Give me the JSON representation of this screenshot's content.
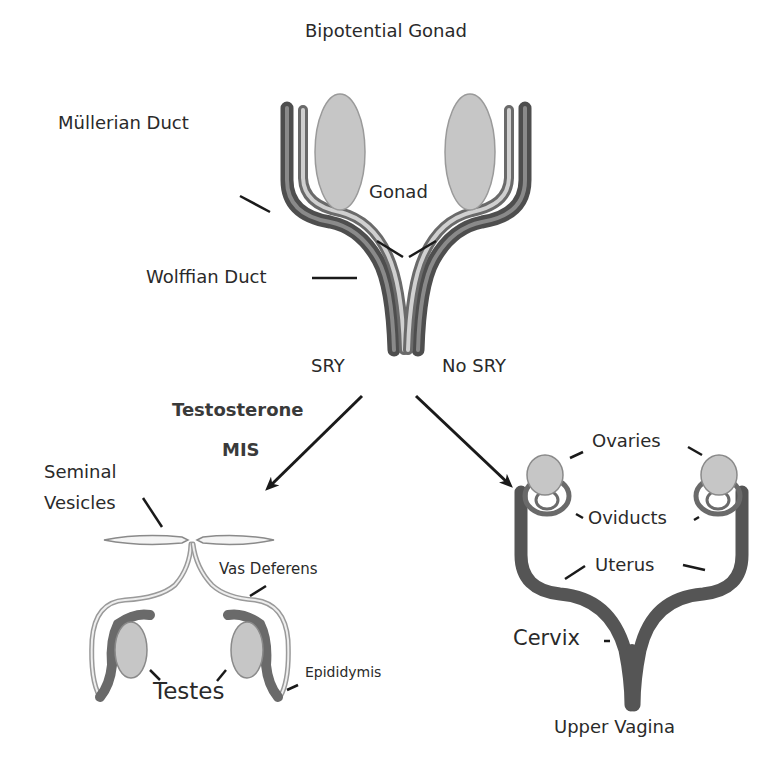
{
  "title": "Bipotential Gonad",
  "top": {
    "labels": {
      "mullerian_duct": "Müllerian Duct",
      "gonad": "Gonad",
      "wolffian_duct": "Wolffian Duct"
    }
  },
  "branches": {
    "male": {
      "trigger": "SRY",
      "factors": [
        "Testosterone",
        "MIS"
      ],
      "labels": {
        "seminal_vesicles_1": "Seminal",
        "seminal_vesicles_2": "Vesicles",
        "vas_deferens": "Vas Deferens",
        "testes": "Testes",
        "epididymis": "Epididymis"
      }
    },
    "female": {
      "trigger": "No SRY",
      "labels": {
        "ovaries": "Ovaries",
        "oviducts": "Oviducts",
        "uterus": "Uterus",
        "cervix": "Cervix",
        "upper_vagina": "Upper Vagina"
      }
    }
  },
  "colors": {
    "duct_dark": "#5a5a5a",
    "duct_light": "#b8b8b8",
    "gonad_fill": "#c8c8c8",
    "text": "#2a2a2a"
  }
}
